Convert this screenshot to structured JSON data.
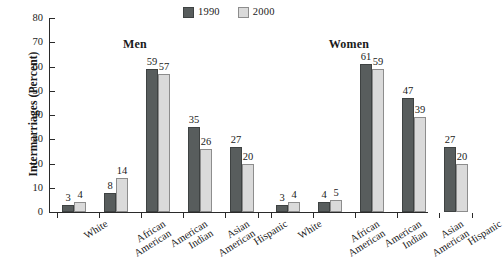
{
  "chart_data": {
    "type": "bar",
    "title": "",
    "xlabel": "",
    "ylabel": "Intermarriages (Percent)",
    "ylim": [
      0,
      80
    ],
    "ytick_values": [
      80,
      70,
      60,
      50,
      40,
      30,
      20,
      10,
      0
    ],
    "ytick_labels": [
      "80",
      "70",
      "60",
      "50",
      "40",
      "30",
      "20",
      "10",
      "0"
    ],
    "grid": false,
    "legend_position": "top-center",
    "legend": [
      {
        "name": "1990",
        "color": "#585d5d"
      },
      {
        "name": "2000",
        "color": "#dadada"
      }
    ],
    "panels": [
      {
        "title": "Men",
        "categories": [
          {
            "line1": "White",
            "line2": ""
          },
          {
            "line1": "African",
            "line2": "American"
          },
          {
            "line1": "American",
            "line2": "Indian"
          },
          {
            "line1": "Asian",
            "line2": "American"
          },
          {
            "line1": "Hispanic",
            "line2": ""
          }
        ],
        "series": [
          {
            "name": "1990",
            "values": [
              3,
              8,
              59,
              35,
              27
            ]
          },
          {
            "name": "2000",
            "values": [
              4,
              14,
              57,
              26,
              20
            ]
          }
        ]
      },
      {
        "title": "Women",
        "categories": [
          {
            "line1": "White",
            "line2": ""
          },
          {
            "line1": "African",
            "line2": "American"
          },
          {
            "line1": "American",
            "line2": "Indian"
          },
          {
            "line1": "Asian",
            "line2": "American"
          },
          {
            "line1": "Hispanic",
            "line2": ""
          }
        ],
        "series": [
          {
            "name": "1990",
            "values": [
              3,
              4,
              61,
              47,
              27
            ]
          },
          {
            "name": "2000",
            "values": [
              4,
              5,
              59,
              39,
              20
            ]
          }
        ]
      }
    ]
  }
}
